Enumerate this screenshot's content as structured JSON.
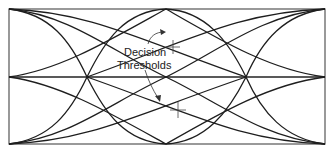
{
  "diagram": {
    "type": "eye-diagram",
    "annotation": {
      "line1": "Decision",
      "line2": "Thresholds"
    },
    "colors": {
      "background": "#ffffff",
      "trace": "#1e1e1e",
      "frame": "#555555"
    },
    "frame": {
      "x0": 9,
      "y0": 9,
      "x1": 325,
      "y1": 144,
      "mid_y": 77
    },
    "crossover_x": [
      87,
      246
    ],
    "eye_peak_x": [
      9,
      166,
      325
    ],
    "decision_thresholds": [
      {
        "x": 173,
        "y": 47
      },
      {
        "x": 178,
        "y": 110
      }
    ]
  }
}
